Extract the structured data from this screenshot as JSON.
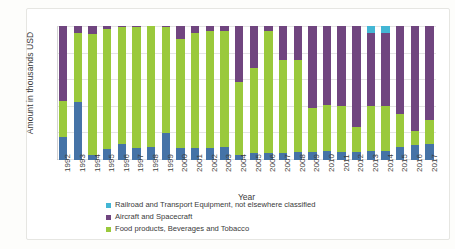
{
  "chart_data": {
    "type": "bar",
    "stacked": "percent",
    "title": "",
    "xlabel": "Year",
    "ylabel": "Amount in thousands USD",
    "ylim": [
      0,
      100
    ],
    "ytick_labels": [
      "0%",
      "20%",
      "40%",
      "60%",
      "80%",
      "100%"
    ],
    "ytick_values": [
      0,
      20,
      40,
      60,
      80,
      100
    ],
    "grid": true,
    "legend_position": "bottom-left",
    "categories": [
      "1992",
      "1993",
      "1994",
      "1995",
      "1996",
      "1997",
      "1998",
      "1999",
      "2000",
      "2001",
      "2002",
      "2003",
      "2004",
      "2005",
      "2006",
      "2007",
      "2008",
      "2009",
      "2010",
      "2011",
      "2012",
      "2013",
      "2014",
      "2015",
      "2016",
      "2017"
    ],
    "series": [
      {
        "name": "Railroad and Transport Equipment, not elsewhere classified",
        "color": "#4573a7",
        "values": [
          17,
          43,
          4,
          8,
          12,
          9,
          10,
          20,
          9,
          9,
          9,
          10,
          4,
          5,
          5,
          5,
          6,
          6,
          7,
          6,
          6,
          7,
          7,
          10,
          11,
          12
        ]
      },
      {
        "name": "Food products, Beverages and Tobacco",
        "color": "#9ac93c",
        "values": [
          27,
          52,
          90,
          90,
          87,
          90,
          90,
          79,
          81,
          86,
          87,
          86,
          54,
          64,
          91,
          70,
          69,
          33,
          34,
          34,
          19,
          33,
          33,
          24,
          11,
          18
        ]
      },
      {
        "name": "Aircraft and Spacecraft",
        "color": "#70457f",
        "values": [
          56,
          5,
          6,
          2,
          1,
          1,
          0,
          1,
          10,
          5,
          4,
          4,
          42,
          31,
          4,
          25,
          25,
          61,
          59,
          60,
          75,
          55,
          55,
          66,
          78,
          70
        ]
      },
      {
        "name": "Other (unlabeled top segment)",
        "color": "#43b6d4",
        "values": [
          0,
          0,
          0,
          0,
          0,
          0,
          0,
          0,
          0,
          0,
          0,
          0,
          0,
          0,
          0,
          0,
          0,
          0,
          0,
          0,
          0,
          5,
          5,
          0,
          0,
          0
        ]
      }
    ]
  },
  "legend": {
    "items": [
      {
        "label": "Railroad and Transport Equipment, not elsewhere classified",
        "color": "#43b6d4"
      },
      {
        "label": "Aircraft and Spacecraft",
        "color": "#70457f"
      },
      {
        "label": "Food products, Beverages and Tobacco",
        "color": "#9ac93c"
      }
    ]
  }
}
